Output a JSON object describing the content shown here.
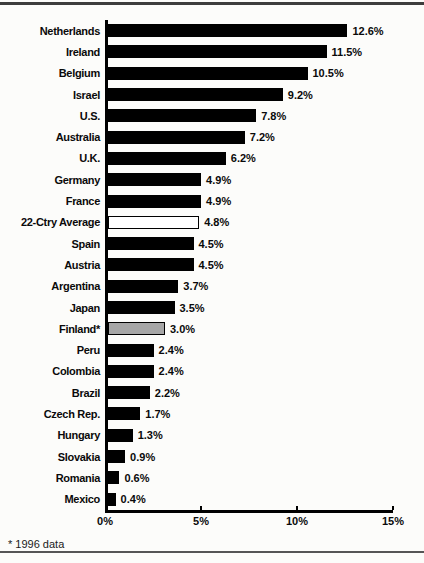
{
  "page": {
    "footnote": "* 1996 data"
  },
  "chart_data": {
    "type": "bar",
    "orientation": "horizontal",
    "title": "",
    "xlabel": "",
    "ylabel": "",
    "xlim": [
      0,
      15
    ],
    "x_ticks": [
      "0%",
      "5%",
      "10%",
      "15%"
    ],
    "x_tick_values": [
      0,
      5,
      10,
      15
    ],
    "grid": false,
    "legend": "none",
    "footnote": "* 1996 data",
    "categories": [
      "Netherlands",
      "Ireland",
      "Belgium",
      "Israel",
      "U.S.",
      "Australia",
      "U.K.",
      "Germany",
      "France",
      "22-Ctry Average",
      "Spain",
      "Austria",
      "Argentina",
      "Japan",
      "Finland*",
      "Peru",
      "Colombia",
      "Brazil",
      "Czech Rep.",
      "Hungary",
      "Slovakia",
      "Romania",
      "Mexico"
    ],
    "values": [
      12.6,
      11.5,
      10.5,
      9.2,
      7.8,
      7.2,
      6.2,
      4.9,
      4.9,
      4.8,
      4.5,
      4.5,
      3.7,
      3.5,
      3.0,
      2.4,
      2.4,
      2.2,
      1.7,
      1.3,
      0.9,
      0.6,
      0.4
    ],
    "bars": [
      {
        "category": "Netherlands",
        "value": 12.6,
        "label": "12.6%",
        "fill": "#000000"
      },
      {
        "category": "Ireland",
        "value": 11.5,
        "label": "11.5%",
        "fill": "#000000"
      },
      {
        "category": "Belgium",
        "value": 10.5,
        "label": "10.5%",
        "fill": "#000000"
      },
      {
        "category": "Israel",
        "value": 9.2,
        "label": "9.2%",
        "fill": "#000000"
      },
      {
        "category": "U.S.",
        "value": 7.8,
        "label": "7.8%",
        "fill": "#000000"
      },
      {
        "category": "Australia",
        "value": 7.2,
        "label": "7.2%",
        "fill": "#000000"
      },
      {
        "category": "U.K.",
        "value": 6.2,
        "label": "6.2%",
        "fill": "#000000"
      },
      {
        "category": "Germany",
        "value": 4.9,
        "label": "4.9%",
        "fill": "#000000"
      },
      {
        "category": "France",
        "value": 4.9,
        "label": "4.9%",
        "fill": "#000000"
      },
      {
        "category": "22-Ctry Average",
        "value": 4.8,
        "label": "4.8%",
        "fill": "#ffffff"
      },
      {
        "category": "Spain",
        "value": 4.5,
        "label": "4.5%",
        "fill": "#000000"
      },
      {
        "category": "Austria",
        "value": 4.5,
        "label": "4.5%",
        "fill": "#000000"
      },
      {
        "category": "Argentina",
        "value": 3.7,
        "label": "3.7%",
        "fill": "#000000"
      },
      {
        "category": "Japan",
        "value": 3.5,
        "label": "3.5%",
        "fill": "#000000"
      },
      {
        "category": "Finland*",
        "value": 3.0,
        "label": "3.0%",
        "fill": "#a6a6a6"
      },
      {
        "category": "Peru",
        "value": 2.4,
        "label": "2.4%",
        "fill": "#000000"
      },
      {
        "category": "Colombia",
        "value": 2.4,
        "label": "2.4%",
        "fill": "#000000"
      },
      {
        "category": "Brazil",
        "value": 2.2,
        "label": "2.2%",
        "fill": "#000000"
      },
      {
        "category": "Czech Rep.",
        "value": 1.7,
        "label": "1.7%",
        "fill": "#000000"
      },
      {
        "category": "Hungary",
        "value": 1.3,
        "label": "1.3%",
        "fill": "#000000"
      },
      {
        "category": "Slovakia",
        "value": 0.9,
        "label": "0.9%",
        "fill": "#000000"
      },
      {
        "category": "Romania",
        "value": 0.6,
        "label": "0.6%",
        "fill": "#000000"
      },
      {
        "category": "Mexico",
        "value": 0.4,
        "label": "0.4%",
        "fill": "#000000"
      }
    ],
    "colors": {
      "bar_default": "#000000",
      "average_bar_fill": "#ffffff",
      "finland_bar_fill": "#a6a6a6",
      "bar_border": "#000000",
      "axis": "#000000",
      "top_rule": "#3d3d3d",
      "bottom_rule": "#565656"
    }
  }
}
